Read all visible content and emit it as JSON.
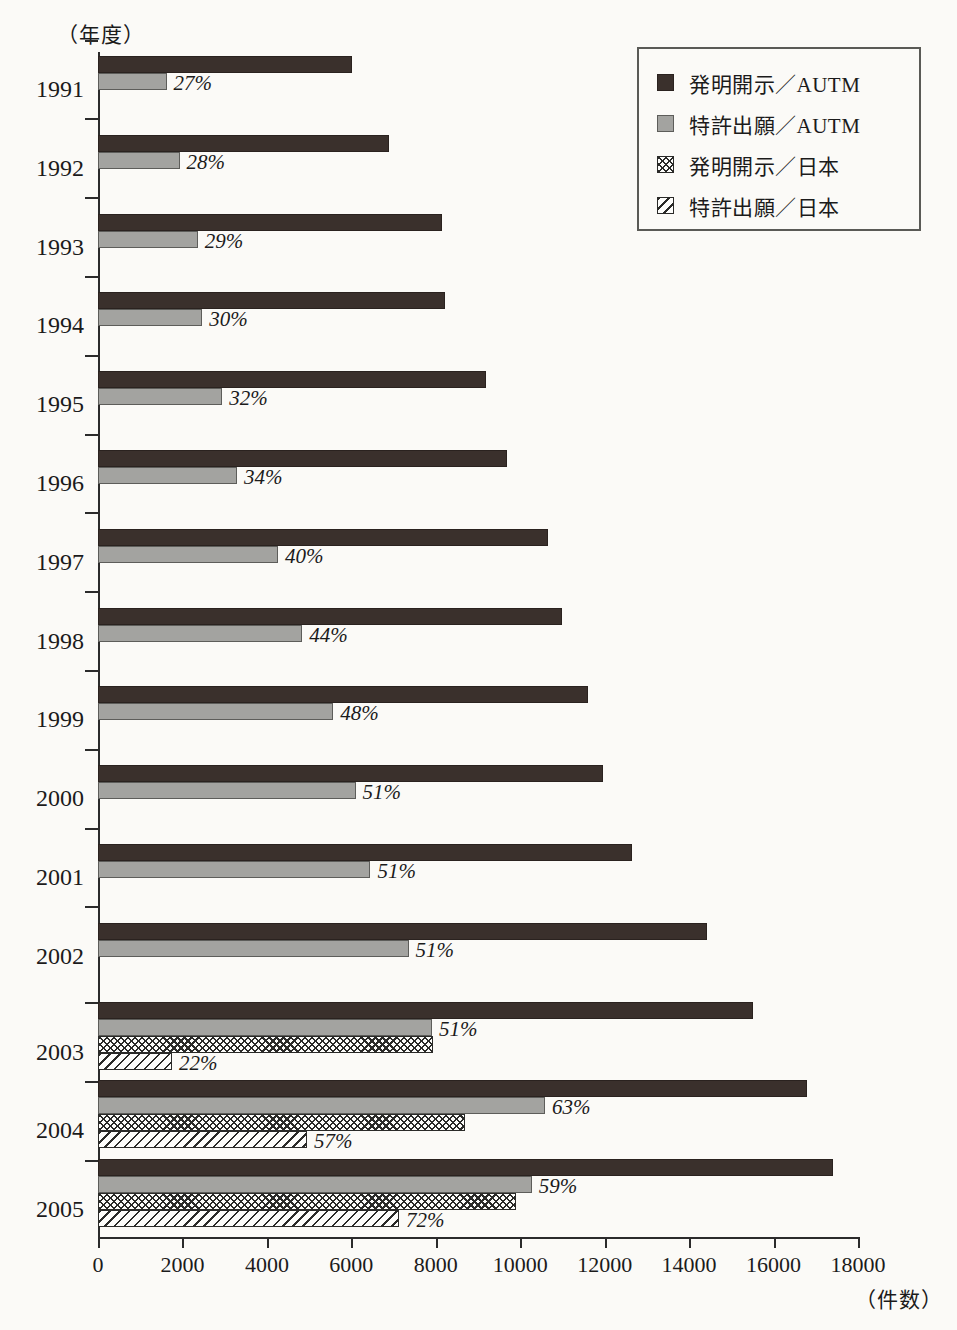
{
  "axis": {
    "y_title": "（年度）",
    "x_title": "（件数）",
    "x_ticks": [
      "0",
      "2000",
      "4000",
      "6000",
      "8000",
      "10000",
      "12000",
      "14000",
      "16000",
      "18000"
    ]
  },
  "legend": {
    "items": [
      {
        "label": "発明開示／AUTM",
        "swatch": "solid-dark-swatch-icon"
      },
      {
        "label": "特許出願／AUTM",
        "swatch": "solid-grey-swatch-icon"
      },
      {
        "label": "発明開示／日本",
        "swatch": "crosshatch-swatch-icon"
      },
      {
        "label": "特許出願／日本",
        "swatch": "diagonal-hatch-swatch-icon"
      }
    ]
  },
  "chart_data": {
    "type": "bar",
    "orientation": "horizontal",
    "title": "",
    "xlabel": "（件数）",
    "ylabel": "（年度）",
    "xlim": [
      0,
      18000
    ],
    "xtick_step": 2000,
    "grid": false,
    "legend_position": "top-right",
    "categories": [
      "1991",
      "1992",
      "1993",
      "1994",
      "1995",
      "1996",
      "1997",
      "1998",
      "1999",
      "2000",
      "2001",
      "2002",
      "2003",
      "2004",
      "2005"
    ],
    "series": [
      {
        "name": "発明開示／AUTM",
        "style": "solid-dark",
        "values": [
          6015,
          6900,
          8150,
          8230,
          9190,
          9690,
          10660,
          10990,
          11610,
          11960,
          12650,
          14420,
          15510,
          16800,
          17410
        ]
      },
      {
        "name": "特許出願／AUTM",
        "style": "solid-grey",
        "values": [
          1624,
          1932,
          2364,
          2469,
          2941,
          3295,
          4264,
          4836,
          5573,
          6100,
          6452,
          7354,
          7910,
          10584,
          10272
        ],
        "labels": [
          "27%",
          "28%",
          "29%",
          "30%",
          "32%",
          "34%",
          "40%",
          "44%",
          "48%",
          "51%",
          "51%",
          "51%",
          "51%",
          "63%",
          "59%"
        ]
      },
      {
        "name": "発明開示／日本",
        "style": "crosshatch",
        "values": [
          null,
          null,
          null,
          null,
          null,
          null,
          null,
          null,
          null,
          null,
          null,
          null,
          7940,
          8690,
          9900
        ]
      },
      {
        "name": "特許出願／日本",
        "style": "diagonal-hatch",
        "values": [
          null,
          null,
          null,
          null,
          null,
          null,
          null,
          null,
          null,
          null,
          null,
          null,
          1750,
          4950,
          7128
        ],
        "labels": [
          null,
          null,
          null,
          null,
          null,
          null,
          null,
          null,
          null,
          null,
          null,
          null,
          "22%",
          "57%",
          "72%"
        ]
      }
    ]
  }
}
